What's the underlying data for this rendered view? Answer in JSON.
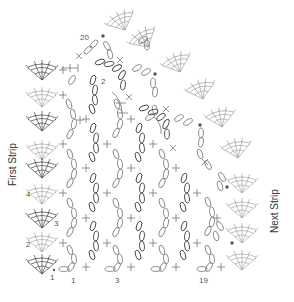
{
  "diagram": {
    "type": "crochet-stitch-chart",
    "labels": {
      "left_strip": "First Strip",
      "right_strip": "Next Strip"
    },
    "row_numbers_left": [
      {
        "text": "4",
        "x": 26,
        "y": 197
      },
      {
        "text": "3",
        "x": 54,
        "y": 226
      },
      {
        "text": "2",
        "x": 26,
        "y": 247
      },
      {
        "text": "1",
        "x": 50,
        "y": 280
      }
    ],
    "column_numbers_bottom": [
      {
        "text": "1",
        "x": 71,
        "y": 283
      },
      {
        "text": "3",
        "x": 115,
        "y": 283
      },
      {
        "text": "19",
        "x": 203,
        "y": 283
      }
    ],
    "inner_numbers": [
      {
        "text": "20",
        "x": 80,
        "y": 40
      },
      {
        "text": "2",
        "x": 101,
        "y": 84
      }
    ],
    "legend_notes": {
      "oval": "chain stitch",
      "plus": "single crochet",
      "x": "single crochet (alt)",
      "dot": "slip stitch",
      "fan": "shell / fan motif"
    },
    "colors": {
      "line": "#777777",
      "dark": "#444444",
      "light": "#999999",
      "text": "#555555",
      "background": "#ffffff"
    }
  }
}
